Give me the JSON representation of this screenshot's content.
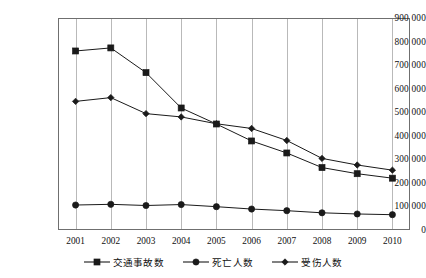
{
  "chart_data": {
    "type": "line",
    "title": "",
    "xlabel": "",
    "ylabel": "",
    "categories": [
      "2001",
      "2002",
      "2003",
      "2004",
      "2005",
      "2006",
      "2007",
      "2008",
      "2009",
      "2010"
    ],
    "ylim": [
      0,
      900000
    ],
    "ytick_values": [
      0,
      100000,
      200000,
      300000,
      400000,
      500000,
      600000,
      700000,
      800000,
      900000
    ],
    "ytick_labels": [
      "0",
      "100 000",
      "200 000",
      "300 000",
      "400 000",
      "500 000",
      "600 000",
      "700 000",
      "800 000",
      "900 000"
    ],
    "grid": "vertical",
    "legend_position": "bottom",
    "line_color": "#1a1a1a",
    "grid_color": "#b9b9b9",
    "axis_color": "#6f6f6f",
    "series": [
      {
        "name": "交通事故数",
        "marker": "square",
        "values": [
          760000,
          773000,
          668000,
          518000,
          450000,
          378000,
          327000,
          265000,
          239000,
          220000
        ]
      },
      {
        "name": "死亡人数",
        "marker": "circle",
        "values": [
          106000,
          109000,
          104000,
          108000,
          99000,
          89000,
          82000,
          73000,
          68000,
          65000
        ]
      },
      {
        "name": "受伤人数",
        "marker": "diamond",
        "values": [
          546000,
          562000,
          494000,
          480000,
          451000,
          431000,
          380000,
          304000,
          276000,
          254000
        ]
      }
    ]
  }
}
